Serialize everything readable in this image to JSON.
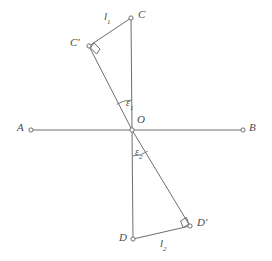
{
  "figure": {
    "background_color": "#ffffff",
    "stroke_color": "#6e6e6e",
    "label_color": "#4a4a4a",
    "width": 272,
    "height": 261
  },
  "points": {
    "A": {
      "label": "A",
      "x": 31,
      "y": 130,
      "label_x": 17,
      "label_y": 124
    },
    "B": {
      "label": "B",
      "x": 243,
      "y": 130,
      "label_x": 249,
      "label_y": 124
    },
    "C": {
      "label": "C",
      "x": 131,
      "y": 18,
      "label_x": 138,
      "label_y": 11
    },
    "Cprime": {
      "label": "C′",
      "x": 89,
      "y": 46,
      "label_x": 71,
      "label_y": 39
    },
    "D": {
      "label": "D",
      "x": 133,
      "y": 239,
      "label_x": 120,
      "label_y": 235
    },
    "Dprime": {
      "label": "D′",
      "x": 190,
      "y": 226,
      "label_x": 197,
      "label_y": 219
    },
    "O": {
      "label": "O",
      "x": 132,
      "y": 130,
      "label_x": 137,
      "label_y": 116
    }
  },
  "segment_labels": {
    "l1": {
      "text": "l",
      "subscript": "1",
      "x": 104,
      "y": 13
    },
    "l2": {
      "text": "l",
      "subscript": "2",
      "x": 160,
      "y": 240
    }
  },
  "angle_labels": {
    "epsilon1": {
      "text": "ε",
      "subscript": "1",
      "x": 126,
      "y": 99
    },
    "epsilon2": {
      "text": "ε",
      "subscript": "2",
      "x": 135,
      "y": 148
    }
  },
  "lines": {
    "AB": {
      "name": "horizontal-axis",
      "x1": 31,
      "y1": 130,
      "x2": 243,
      "y2": 130
    },
    "CO": {
      "name": "vertical-upper",
      "x1": 131,
      "y1": 18,
      "x2": 132,
      "y2": 130
    },
    "OD": {
      "name": "vertical-lower",
      "x1": 132,
      "y1": 130,
      "x2": 133,
      "y2": 239
    },
    "CprimeO": {
      "name": "oblique-upper",
      "x1": 89,
      "y1": 46,
      "x2": 132,
      "y2": 130
    },
    "ODprime": {
      "name": "oblique-lower",
      "x1": 132,
      "y1": 130,
      "x2": 190,
      "y2": 226
    },
    "CCprime": {
      "name": "segment-l1",
      "x1": 131,
      "y1": 18,
      "x2": 89,
      "y2": 46
    },
    "DDprime": {
      "name": "segment-l2",
      "x1": 133,
      "y1": 239,
      "x2": 190,
      "y2": 226
    }
  },
  "right_angles": {
    "at_Cprime": {
      "vertex_x": 89,
      "vertex_y": 46
    },
    "at_Dprime": {
      "vertex_x": 190,
      "vertex_y": 226
    }
  },
  "angle_arcs": {
    "epsilon1": {
      "center_x": 132,
      "center_y": 130,
      "radius": 30
    },
    "epsilon2": {
      "center_x": 132,
      "center_y": 130,
      "radius": 26
    }
  }
}
